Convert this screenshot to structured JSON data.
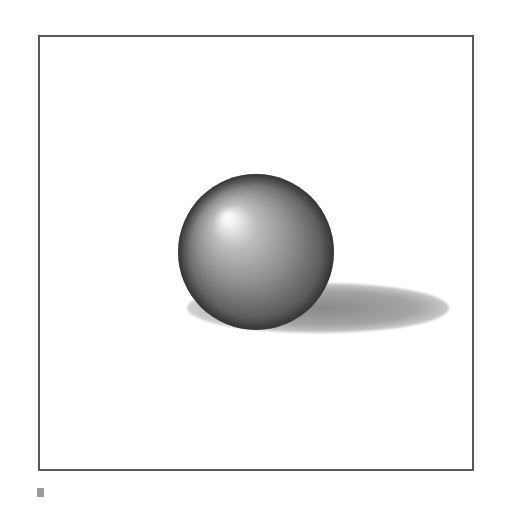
{
  "figure": {
    "frame": {
      "x": 39,
      "y": 36,
      "width": 433,
      "height": 433,
      "stroke": "#585858"
    },
    "sphere": {
      "cx": 256,
      "cy": 252,
      "r": 78,
      "highlight": {
        "cx": 227,
        "cy": 216
      },
      "colors": {
        "highlight": "#ffffff",
        "mid": "#a6a6a6",
        "dark": "#4a4a4a",
        "edge": "#3c3c3c"
      }
    },
    "shadow": {
      "cx": 318,
      "cy": 308,
      "rx": 131,
      "ry": 25,
      "colors": {
        "inner": "#8c8c8c",
        "outer": "#c8c8c8"
      }
    },
    "marker": {
      "color": "#9a9a9a"
    }
  }
}
